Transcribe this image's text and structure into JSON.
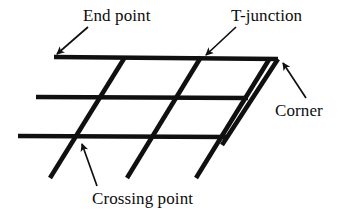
{
  "figure": {
    "background_color": "#ffffff",
    "stroke_color": "#101010",
    "labels": [
      {
        "id": "end-point",
        "text": "End point"
      },
      {
        "id": "t-junction",
        "text": "T-junction"
      },
      {
        "id": "corner",
        "text": "Corner"
      },
      {
        "id": "crossing-point",
        "text": "Crossing point"
      }
    ],
    "diagram": {
      "description": "A lattice of three nearly-horizontal thick lines crossed by four parallel thick diagonal lines rising to the right, annotated with four arrow callouts.",
      "horizontal_lines": [
        {
          "id": "top-horizontal",
          "x1": 54,
          "y1": 57,
          "x2": 278,
          "y2": 59
        },
        {
          "id": "middle-horizontal",
          "x1": 36,
          "y1": 97,
          "x2": 248,
          "y2": 98
        },
        {
          "id": "bottom-horizontal",
          "x1": 18,
          "y1": 136,
          "x2": 228,
          "y2": 137
        }
      ],
      "diagonal_lines": [
        {
          "id": "diagonal-1",
          "x1": 50,
          "y1": 178,
          "x2": 125,
          "y2": 57
        },
        {
          "id": "diagonal-2",
          "x1": 127,
          "y1": 178,
          "x2": 201,
          "y2": 57
        },
        {
          "id": "diagonal-3",
          "x1": 196,
          "y1": 178,
          "x2": 270,
          "y2": 58
        },
        {
          "id": "diagonal-4",
          "x1": 222,
          "y1": 145,
          "x2": 278,
          "y2": 59
        }
      ],
      "arrows": [
        {
          "id": "arrow-end-point",
          "tail_x": 88,
          "tail_y": 27,
          "tip_x": 55,
          "tip_y": 56
        },
        {
          "id": "arrow-t-junction",
          "tail_x": 236,
          "tail_y": 27,
          "tip_x": 204,
          "tip_y": 57
        },
        {
          "id": "arrow-corner",
          "tail_x": 306,
          "tail_y": 98,
          "tip_x": 281,
          "tip_y": 60
        },
        {
          "id": "arrow-crossing-point",
          "tail_x": 97,
          "tail_y": 186,
          "tip_x": 81,
          "tip_y": 141
        }
      ]
    }
  }
}
